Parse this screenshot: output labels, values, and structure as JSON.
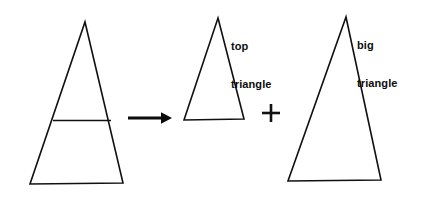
{
  "figure": {
    "type": "geometry-diagram",
    "background_color": "#ffffff",
    "stroke_color": "#111111"
  },
  "labels": {
    "top_triangle": {
      "line1": "top",
      "line2": "triangle"
    },
    "big_triangle": {
      "line1": "big",
      "line2": "triangle"
    }
  },
  "operators": {
    "arrow": "→",
    "plus": "+"
  },
  "shapes": [
    {
      "name": "composite-triangle",
      "role": "source",
      "apex": [
        85,
        22
      ],
      "base_left": [
        30,
        184
      ],
      "base_right": [
        123,
        183
      ],
      "divider": {
        "y": 120,
        "x_left": 53,
        "x_right": 111
      }
    },
    {
      "name": "top-triangle",
      "role": "part",
      "apex": [
        218,
        18
      ],
      "base_left": [
        184,
        120
      ],
      "base_right": [
        244,
        119
      ]
    },
    {
      "name": "big-triangle",
      "role": "part",
      "apex": [
        346,
        17
      ],
      "base_left": [
        288,
        181
      ],
      "base_right": [
        381,
        180
      ]
    }
  ],
  "arrow": {
    "x_start": 128,
    "x_end": 171,
    "y": 118
  },
  "plus_sign": {
    "center_x": 271,
    "center_y": 113,
    "arm": 9
  }
}
